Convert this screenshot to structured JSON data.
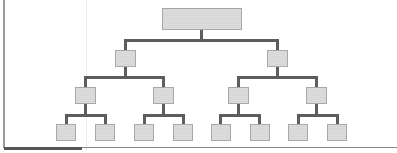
{
  "diagram": {
    "type": "hierarchy-tree",
    "title": "",
    "colors": {
      "node_fill": "#d6d6d6",
      "node_border": "#a8a8a8",
      "connector": "#5d5d5d",
      "frame": "#9a9a9a"
    },
    "levels": 4,
    "structure": {
      "root": {
        "label": "",
        "children": [
          {
            "label": "",
            "children": [
              {
                "label": "",
                "children": [
                  {
                    "label": ""
                  },
                  {
                    "label": ""
                  }
                ]
              },
              {
                "label": "",
                "children": [
                  {
                    "label": ""
                  },
                  {
                    "label": ""
                  }
                ]
              }
            ]
          },
          {
            "label": "",
            "children": [
              {
                "label": "",
                "children": [
                  {
                    "label": ""
                  },
                  {
                    "label": ""
                  }
                ]
              },
              {
                "label": "",
                "children": [
                  {
                    "label": ""
                  },
                  {
                    "label": ""
                  }
                ]
              }
            ]
          }
        ]
      }
    },
    "node_counts": {
      "level1": 1,
      "level2": 2,
      "level3": 4,
      "level4": 8
    }
  }
}
